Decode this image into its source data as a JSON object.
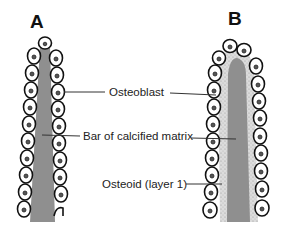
{
  "panels": [
    {
      "id": "A",
      "letter": "A",
      "description": "Bar of calcified matrix lined by osteoblasts"
    },
    {
      "id": "B",
      "letter": "B",
      "description": "Osteoblasts deposit osteoid (layer 1) onto calcified matrix"
    }
  ],
  "labels": {
    "osteoblast": "Osteoblast",
    "calcified_matrix": "Bar of calcified matrix",
    "osteoid": "Osteoid (layer 1)"
  },
  "colors": {
    "calcified_matrix": "#8f8f8f",
    "osteoid": "#d9d9d9",
    "cell_outline": "#111111",
    "nucleus": "#555555",
    "background": "#ffffff"
  }
}
